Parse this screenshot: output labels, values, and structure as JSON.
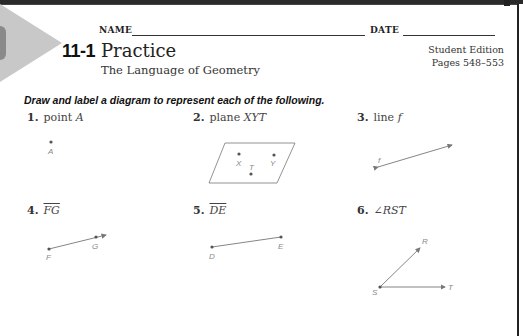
{
  "header": {
    "name_label": "NAME",
    "date_label": "DATE",
    "lesson_number": "11-1",
    "title": "Practice",
    "subtitle": "The Language of Geometry",
    "edition_line1": "Student Edition",
    "edition_line2": "Pages 548–553"
  },
  "instructions": "Draw and label a diagram to represent each of the following.",
  "problems": [
    {
      "number": "1.",
      "text": "point ",
      "var": "A",
      "figure": {
        "type": "point",
        "labels": [
          "A"
        ]
      }
    },
    {
      "number": "2.",
      "text": "plane ",
      "var": "XYT",
      "figure": {
        "type": "plane",
        "labels": [
          "X",
          "T",
          "Y"
        ]
      }
    },
    {
      "number": "3.",
      "text": "line ",
      "var": "f",
      "figure": {
        "type": "line",
        "labels": [
          "f"
        ]
      }
    },
    {
      "number": "4.",
      "text": "",
      "var": "FG",
      "figure": {
        "type": "ray",
        "labels": [
          "F",
          "G"
        ]
      }
    },
    {
      "number": "5.",
      "text": "",
      "var": "DE",
      "figure": {
        "type": "segment",
        "labels": [
          "D",
          "E"
        ]
      }
    },
    {
      "number": "6.",
      "text": "∠",
      "var": "RST",
      "figure": {
        "type": "angle",
        "labels": [
          "R",
          "S",
          "T"
        ]
      }
    }
  ]
}
